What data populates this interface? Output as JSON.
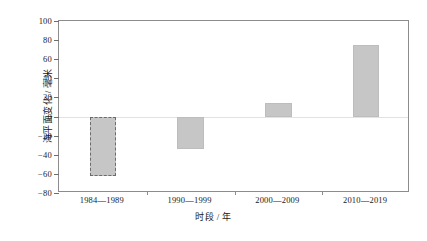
{
  "chart_data": {
    "type": "bar",
    "title": "",
    "categories": [
      "1984—1989",
      "1990—1999",
      "2000—2009",
      "2010—2019"
    ],
    "values": [
      -62,
      -34,
      14,
      75
    ],
    "xlabel": "时段 / 年",
    "ylabel": "海平面变化 / 毫米",
    "ylim": [
      -80,
      100
    ],
    "ytick_step": 20,
    "yticks": [
      100,
      80,
      60,
      40,
      20,
      0,
      -20,
      -40,
      -60,
      -80
    ],
    "ytick_labels": [
      "100",
      "80",
      "60",
      "40",
      "20",
      "0",
      "−20",
      "−40",
      "−60",
      "−80"
    ],
    "grid": false,
    "legend": false,
    "zero_line": true,
    "bar_styles": [
      "dashed-outline",
      "solid",
      "solid",
      "solid"
    ],
    "colors": {
      "bar_fill": "#c6c6c6",
      "bar_edge_solid": "#bdbdbd",
      "bar_edge_dashed": "#6b6b6b",
      "frame": "#8c8c8c",
      "zero_line": "#e2e2e2",
      "text": "#1a1a1a",
      "background": "#ffffff"
    }
  }
}
